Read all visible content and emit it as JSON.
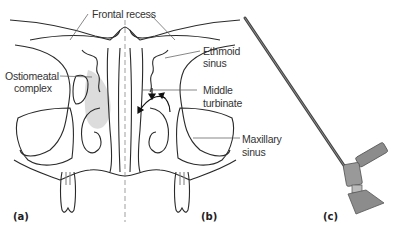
{
  "figure": {
    "labels": {
      "frontal_recess": "Frontal recess",
      "ostiomeatal_line1": "Ostiomeatal",
      "ostiomeatal_line2": "complex",
      "ethmoid_line1": "Ethmoid",
      "ethmoid_line2": "sinus",
      "middle_turbinate_line1": "Middle",
      "middle_turbinate_line2": "turbinate",
      "maxillary_line1": "Maxillary",
      "maxillary_line2": "sinus"
    },
    "panels": {
      "a": "(a)",
      "b": "(b)",
      "c": "(c)"
    },
    "colors": {
      "line": "#2a2a2a",
      "leader": "#555555",
      "shade": "#dcdcdc",
      "scope_dark": "#444444",
      "scope_metal": "#8c8c8c"
    }
  }
}
